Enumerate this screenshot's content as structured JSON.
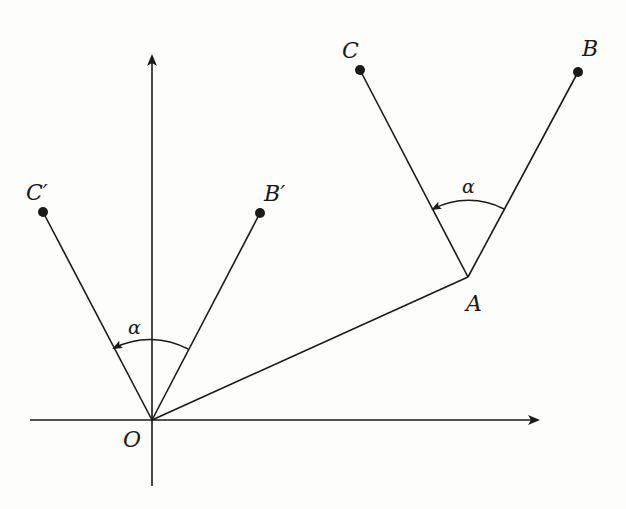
{
  "diagram": {
    "type": "rotation-of-vectors",
    "colors": {
      "ink": "#1a1a1a",
      "background": "#fdfdfb"
    },
    "axes": {
      "x_axis": "horizontal",
      "y_axis": "vertical",
      "origin_label": "O"
    },
    "points": {
      "O": {
        "label": "O",
        "x": 152,
        "y": 420
      },
      "A": {
        "label": "A",
        "x": 468,
        "y": 277
      },
      "B": {
        "label": "B",
        "x": 578,
        "y": 72
      },
      "C": {
        "label": "C",
        "x": 360,
        "y": 70
      },
      "B_prime": {
        "label": "B′",
        "x": 260,
        "y": 213
      },
      "C_prime": {
        "label": "C′",
        "x": 43,
        "y": 212
      }
    },
    "segments": [
      {
        "from": "O",
        "to": "A"
      },
      {
        "from": "A",
        "to": "B"
      },
      {
        "from": "A",
        "to": "C"
      },
      {
        "from": "O",
        "to": "B_prime"
      },
      {
        "from": "O",
        "to": "C_prime"
      }
    ],
    "angles": [
      {
        "vertex": "A",
        "from": "B",
        "to": "C",
        "label": "α",
        "direction": "counterclockwise"
      },
      {
        "vertex": "O",
        "from": "B_prime",
        "to": "C_prime",
        "label": "α",
        "direction": "counterclockwise"
      }
    ]
  }
}
